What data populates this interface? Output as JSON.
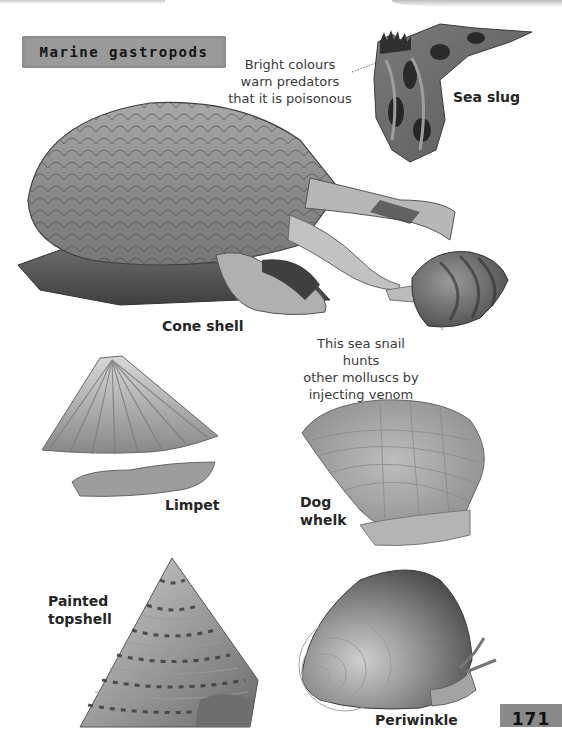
{
  "page": {
    "section_heading": "Marine gastropods",
    "page_number": "171",
    "palette": {
      "background": "#ffffff",
      "heading_band": "#9a9a9a",
      "text": "#262626",
      "caption_text": "#3a3a3a"
    }
  },
  "annotations": [
    {
      "id": "sea-slug-note",
      "lines": [
        "Bright colours",
        "warn predators",
        "that it is poisonous"
      ]
    },
    {
      "id": "cone-shell-note",
      "lines": [
        "This sea snail hunts",
        "other molluscs by",
        "injecting venom"
      ]
    }
  ],
  "specimens": [
    {
      "id": "sea-slug",
      "label": "Sea slug",
      "icon": "sea-slug-illustration"
    },
    {
      "id": "cone-shell",
      "label": "Cone shell",
      "icon": "cone-shell-illustration"
    },
    {
      "id": "prey-snail",
      "label": "",
      "icon": "prey-snail-illustration"
    },
    {
      "id": "limpet",
      "label": "Limpet",
      "icon": "limpet-illustration"
    },
    {
      "id": "dog-whelk",
      "label_lines": [
        "Dog",
        "whelk"
      ],
      "icon": "dog-whelk-illustration"
    },
    {
      "id": "painted-topshell",
      "label_lines": [
        "Painted",
        "topshell"
      ],
      "icon": "painted-topshell-illustration"
    },
    {
      "id": "periwinkle",
      "label": "Periwinkle",
      "icon": "periwinkle-illustration"
    }
  ]
}
